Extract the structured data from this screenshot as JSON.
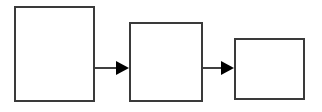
{
  "canvas": {
    "width": 322,
    "height": 112,
    "background_color": "#ffffff",
    "title": "Three-stage linear process flowchart"
  },
  "style": {
    "box_stroke_color": "#3a3a3a",
    "box_fill_color": "#ffffff",
    "box_stroke_width": 2,
    "connector_color": "#000000",
    "connector_stroke_width": 1.5
  },
  "diagram": {
    "type": "flowchart",
    "orientation": "left-to-right",
    "node_count": 3,
    "connector_count": 2,
    "nodes": [
      {
        "id": "node-1",
        "label": "",
        "shape": "rectangle",
        "x": 14,
        "y": 6,
        "width": 81,
        "height": 96
      },
      {
        "id": "node-2",
        "label": "",
        "shape": "rectangle",
        "x": 129,
        "y": 22,
        "width": 74,
        "height": 80
      },
      {
        "id": "node-3",
        "label": "",
        "shape": "rectangle",
        "x": 234,
        "y": 38,
        "width": 71,
        "height": 62
      }
    ],
    "connectors": [
      {
        "id": "connector-1",
        "label": "",
        "from": "node-1",
        "to": "node-2",
        "arrowhead": "solid-triangle",
        "x1": 95,
        "y1": 68,
        "x2": 129,
        "y2": 68
      },
      {
        "id": "connector-2",
        "label": "",
        "from": "node-2",
        "to": "node-3",
        "arrowhead": "solid-triangle",
        "x1": 203,
        "y1": 68,
        "x2": 234,
        "y2": 68
      }
    ]
  }
}
